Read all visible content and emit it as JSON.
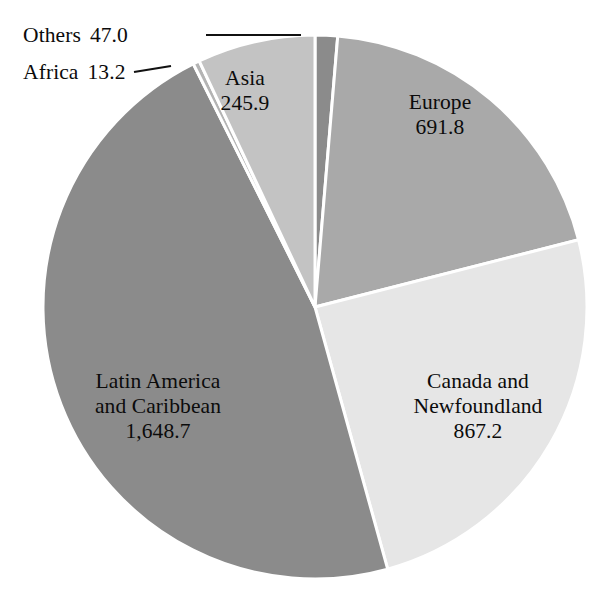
{
  "chart_data": {
    "type": "pie",
    "title": "",
    "subtitle": "",
    "xlabel": "",
    "ylabel": "",
    "legend_position": "none",
    "grid": false,
    "total": 3513.8,
    "value_format": "one decimal, thousands separated by comma",
    "categories": [
      "Europe",
      "Canada and Newfoundland",
      "Latin America and Caribbean",
      "Africa",
      "Asia",
      "Others"
    ],
    "values": [
      691.8,
      867.2,
      1648.7,
      13.2,
      245.9,
      47.0
    ],
    "slices": [
      {
        "name": "Others",
        "label_lines": [
          "Others"
        ],
        "value": 47.0,
        "value_text": "47.0",
        "percent": 1.3,
        "color": "#8b8b8b",
        "label_style": "callout",
        "start_angle": 0.0,
        "end_angle": 4.8
      },
      {
        "name": "Europe",
        "label_lines": [
          "Europe"
        ],
        "value": 691.8,
        "value_text": "691.8",
        "percent": 19.7,
        "color": "#a9a9a9",
        "label_style": "inside",
        "start_angle": 4.8,
        "end_angle": 75.7
      },
      {
        "name": "Canada and Newfoundland",
        "label_lines": [
          "Canada and",
          "Newfoundland"
        ],
        "value": 867.2,
        "value_text": "867.2",
        "percent": 24.7,
        "color": "#e6e6e6",
        "label_style": "inside",
        "start_angle": 75.7,
        "end_angle": 164.5
      },
      {
        "name": "Latin America and Caribbean",
        "label_lines": [
          "Latin America",
          "and Caribbean"
        ],
        "value": 1648.7,
        "value_text": "1,648.7",
        "percent": 46.9,
        "color": "#8b8b8b",
        "label_style": "inside",
        "start_angle": 164.5,
        "end_angle": 333.4
      },
      {
        "name": "Africa",
        "label_lines": [
          "Africa"
        ],
        "value": 13.2,
        "value_text": "13.2",
        "percent": 0.4,
        "color": "#b4b4b4",
        "label_style": "callout",
        "start_angle": 333.4,
        "end_angle": 334.8
      },
      {
        "name": "Asia",
        "label_lines": [
          "Asia"
        ],
        "value": 245.9,
        "value_text": "245.9",
        "percent": 7.0,
        "color": "#c3c3c3",
        "label_style": "inside",
        "start_angle": 334.8,
        "end_angle": 360.0
      }
    ]
  },
  "labels": {
    "europe": {
      "line1": "Europe",
      "value": "691.8"
    },
    "canada": {
      "line1": "Canada and",
      "line2": "Newfoundland",
      "value": "867.2"
    },
    "latin": {
      "line1": "Latin America",
      "line2": "and Caribbean",
      "value": "1,648.7"
    },
    "asia": {
      "line1": "Asia",
      "value": "245.9"
    },
    "others": {
      "name": "Others",
      "value": "47.0"
    },
    "africa": {
      "name": "Africa",
      "value": "13.2"
    }
  },
  "colors": {
    "background": "#ffffff",
    "separator": "#ffffff",
    "text": "#0b0b0b",
    "leader_line": "#111111",
    "others_slice": "#8b8b8b",
    "europe_slice": "#a9a9a9",
    "canada_slice": "#e6e6e6",
    "latin_slice": "#8b8b8b",
    "africa_slice": "#b4b4b4",
    "asia_slice": "#c3c3c3"
  }
}
